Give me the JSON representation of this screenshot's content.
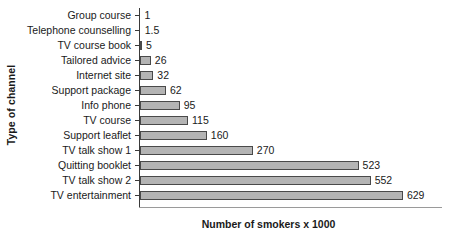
{
  "chart_data": {
    "type": "bar",
    "orientation": "horizontal",
    "title": "",
    "xlabel": "Number of smokers x 1000",
    "ylabel": "Type of channel",
    "categories": [
      "Group course",
      "Telephone counselling",
      "TV course book",
      "Tailored advice",
      "Internet site",
      "Support package",
      "Info phone",
      "TV course",
      "Support leaflet",
      "TV talk show 1",
      "Quitting booklet",
      "TV talk show 2",
      "TV entertainment"
    ],
    "values": [
      1,
      1.5,
      5,
      26,
      32,
      62,
      95,
      115,
      160,
      270,
      523,
      552,
      629
    ],
    "value_labels": [
      "1",
      "1.5",
      "5",
      "26",
      "32",
      "62",
      "95",
      "115",
      "160",
      "270",
      "523",
      "552",
      "629"
    ],
    "xlim": [
      0,
      725
    ],
    "ylim": null,
    "grid": false,
    "legend": null,
    "bar_fill_color": "#b4b4b4",
    "bar_border_color": "#4a4a4a",
    "axis_color": "#3a3a3a",
    "background_color": "#ffffff"
  }
}
